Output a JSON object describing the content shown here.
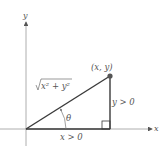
{
  "diagram": {
    "axes": {
      "x_label": "x",
      "y_label": "y"
    },
    "point_label": "(x, y)",
    "hypotenuse_label": "x² + y²",
    "angle_label": "θ",
    "vertical_leg_label": "y > 0",
    "horizontal_leg_label": "x > 0",
    "colors": {
      "axis": "#9a9a9a",
      "triangle": "#3a3a3a",
      "point": "#555555",
      "text": "#555555"
    }
  }
}
